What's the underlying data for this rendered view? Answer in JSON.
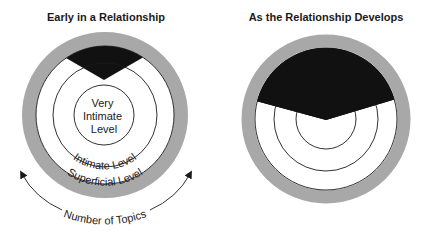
{
  "panels": [
    {
      "id": "early",
      "title": "Early in a Relationship",
      "levels": {
        "inner": [
          "Very",
          "Intimate",
          "Level"
        ],
        "middle": "Intimate Level",
        "outer": "Superficial Level"
      },
      "axis_label": "Number of Topics"
    },
    {
      "id": "develops",
      "title": "As the Relationship Develops"
    }
  ],
  "colors": {
    "ring": "#a8a8a8",
    "wedge": "#111111",
    "line": "#1a1a1a",
    "background": "#ffffff"
  }
}
